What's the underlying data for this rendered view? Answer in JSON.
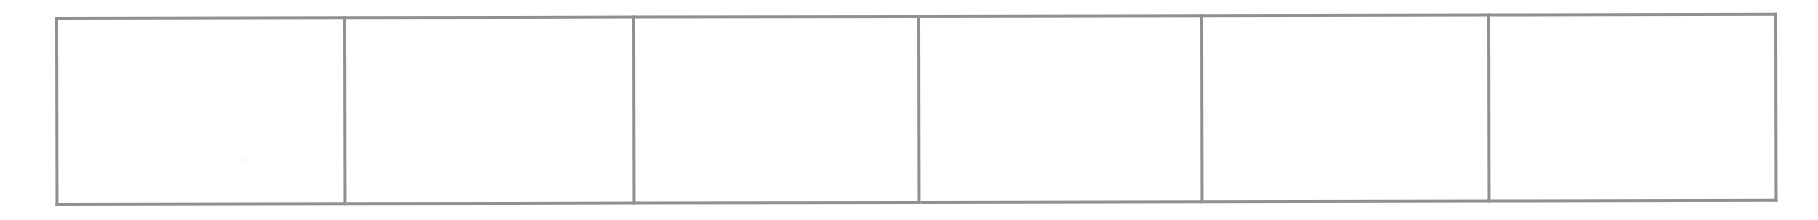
{
  "document": {
    "kind": "scanned-blank-table-form",
    "background_color": "#ffffff",
    "page_width": 1818,
    "page_height": 220
  },
  "table": {
    "name": "blank-grid-table",
    "border_color": "#8e9094",
    "border_width_px": 3,
    "cell_fill_color": "#ffffff",
    "row_count": 1,
    "column_count": 6,
    "bounds": {
      "left": 55,
      "top": 17,
      "right": 1774,
      "bottom": 206
    },
    "column_divider_x": [
      343,
      632,
      917,
      1200,
      1487
    ],
    "column_widths_px": [
      288,
      289,
      285,
      283,
      287,
      287
    ],
    "rows": [
      {
        "name": "table-row-1",
        "cells": [
          {
            "name": "cell-r1c1",
            "text": ""
          },
          {
            "name": "cell-r1c2",
            "text": ""
          },
          {
            "name": "cell-r1c3",
            "text": ""
          },
          {
            "name": "cell-r1c4",
            "text": ""
          },
          {
            "name": "cell-r1c5",
            "text": ""
          },
          {
            "name": "cell-r1c6",
            "text": ""
          }
        ]
      }
    ]
  }
}
